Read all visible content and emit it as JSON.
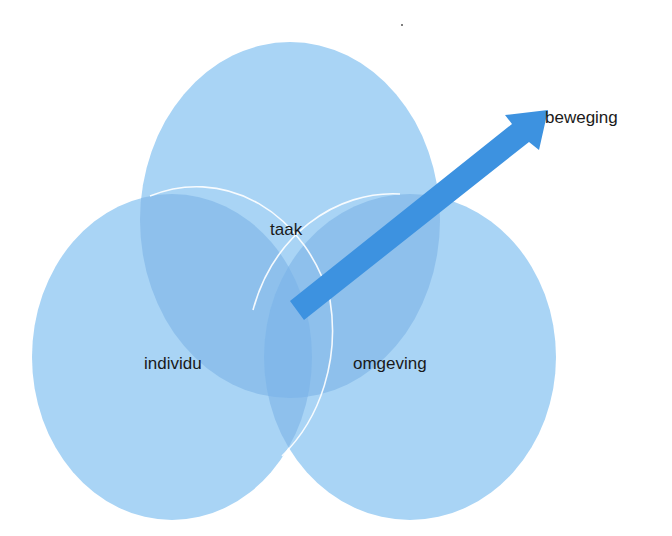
{
  "diagram": {
    "type": "venn-with-arrow",
    "colors": {
      "circle_fill": "#a9d4f5",
      "overlap_fill": "#8ec0ec",
      "center_overlap_fill": "#7fb5e8",
      "circle_stroke": "#ffffff",
      "arrow_fill": "#3d92e0",
      "label_color": "#1a1a1a"
    },
    "circles": [
      {
        "id": "taak",
        "label": "taak"
      },
      {
        "id": "individu",
        "label": "individu"
      },
      {
        "id": "omgeving",
        "label": "omgeving"
      }
    ],
    "arrow": {
      "label": "beweging"
    }
  }
}
